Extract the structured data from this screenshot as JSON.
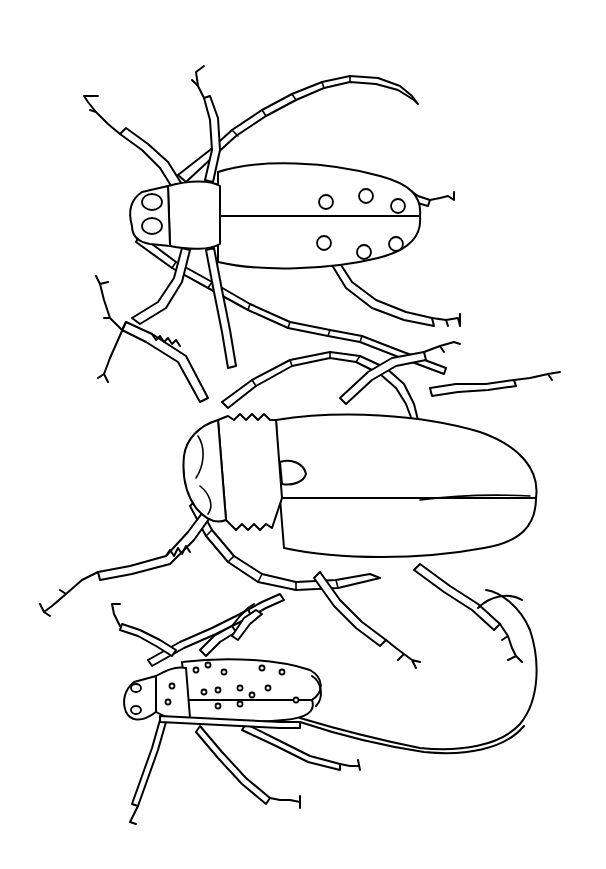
{
  "image": {
    "kind": "coloring-page line art",
    "subject": "three longhorn beetles",
    "background_color": "#ffffff",
    "line_color": "#000000"
  },
  "beetles": [
    {
      "id": "top",
      "label": "spotted longhorn beetle",
      "spots": 6
    },
    {
      "id": "middle",
      "label": "large longhorn beetle with serrated legs",
      "spots": 0
    },
    {
      "id": "bottom",
      "label": "small speckled longhorn beetle with long curling antenna",
      "spots": 16
    }
  ]
}
